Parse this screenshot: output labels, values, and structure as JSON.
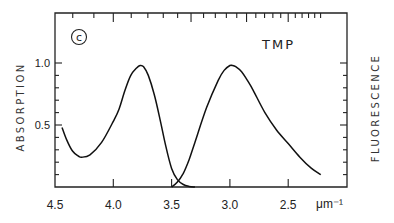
{
  "chart_data": {
    "type": "line",
    "title": "",
    "panel_label": "c",
    "annotation": "TMP",
    "xlabel": "μm⁻¹",
    "ylabel_left": "ABSORPTION",
    "ylabel_right": "FLUORESCENCE",
    "xlim": [
      4.5,
      2.2
    ],
    "ylim": [
      0,
      1.4
    ],
    "x_reversed": true,
    "x_ticks": [
      4.5,
      4.0,
      3.5,
      3.0,
      2.5
    ],
    "x_tick_labels": [
      "4.5",
      "4.0",
      "3.5",
      "3.0",
      "2.5"
    ],
    "y_left_ticks": [
      0.5,
      1.0
    ],
    "y_left_tick_labels": [
      "0.5",
      "1.0"
    ],
    "y_minor_step": 0.1,
    "top_axis": {
      "unit": "nm (wavelength, unlabeled)",
      "minor_ticks_nm": [
        230,
        240,
        250,
        260,
        270,
        280,
        290,
        300,
        310,
        320,
        330,
        340,
        350,
        360,
        370,
        380,
        390,
        400,
        410,
        420,
        430,
        440,
        450
      ],
      "major_ticks_nm": [
        250,
        300,
        350,
        400
      ]
    },
    "grid": false,
    "legend": null,
    "series": [
      {
        "name": "Absorption",
        "x": [
          4.44,
          4.4,
          4.35,
          4.3,
          4.27,
          4.2,
          4.1,
          4.0,
          3.95,
          3.9,
          3.85,
          3.8,
          3.77,
          3.74,
          3.7,
          3.65,
          3.6,
          3.55,
          3.5,
          3.45,
          3.4,
          3.35,
          3.3
        ],
        "values": [
          0.48,
          0.38,
          0.29,
          0.25,
          0.24,
          0.26,
          0.36,
          0.53,
          0.63,
          0.78,
          0.9,
          0.96,
          0.98,
          0.97,
          0.9,
          0.75,
          0.55,
          0.33,
          0.15,
          0.06,
          0.02,
          0.005,
          0.0
        ]
      },
      {
        "name": "Fluorescence",
        "x": [
          3.5,
          3.45,
          3.4,
          3.35,
          3.3,
          3.2,
          3.1,
          3.05,
          3.0,
          2.98,
          2.95,
          2.9,
          2.85,
          2.8,
          2.7,
          2.6,
          2.5,
          2.4,
          2.3,
          2.22
        ],
        "values": [
          0.0,
          0.04,
          0.11,
          0.22,
          0.36,
          0.64,
          0.86,
          0.94,
          0.98,
          0.98,
          0.97,
          0.93,
          0.86,
          0.78,
          0.6,
          0.46,
          0.35,
          0.24,
          0.15,
          0.1
        ]
      }
    ]
  }
}
